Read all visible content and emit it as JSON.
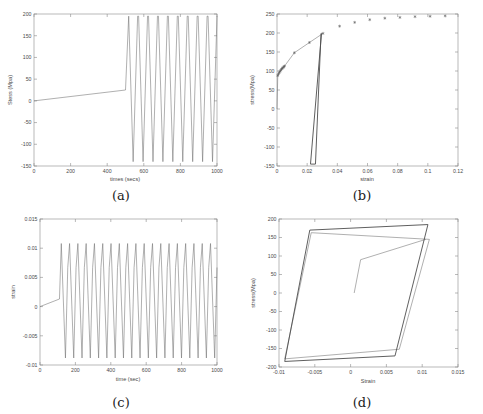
{
  "figure": {
    "panels": [
      {
        "id": "a",
        "caption": "(a)",
        "chart_data": {
          "type": "line",
          "title": "",
          "xlabel": "times (secs)",
          "ylabel": "Stess (Mpa)",
          "xlim": [
            0,
            1000
          ],
          "ylim": [
            -150,
            200
          ],
          "xticks": [
            0,
            200,
            400,
            600,
            800,
            1000
          ],
          "yticks": [
            -150,
            -100,
            -50,
            0,
            50,
            100,
            150,
            200
          ],
          "xticklabels": [
            "0",
            "200",
            "400",
            "600",
            "800",
            "1000"
          ],
          "yticklabels": [
            "-150",
            "-100",
            "-50",
            "0",
            "50",
            "100",
            "150",
            "200"
          ],
          "grid": false,
          "legend": "none",
          "series": [
            {
              "name": "stress history",
              "description": "slow monotonic ramp from 0 to about 25 MPa over the first 500 s, then a sharp rise to 195 MPa followed by nine sustained cycles between about 195 and -140 MPa",
              "ramp": {
                "x": [
                  0,
                  500
                ],
                "y": [
                  0,
                  25
                ]
              },
              "jump": {
                "x": [
                  500,
                  512
                ],
                "y": [
                  25,
                  195
                ]
              },
              "cycles": {
                "n": 9,
                "x_start": 512,
                "x_end": 1000,
                "ymax": 195,
                "ymin": -140
              }
            }
          ]
        }
      },
      {
        "id": "b",
        "caption": "(b)",
        "chart_data": {
          "type": "scatter",
          "title": "",
          "xlabel": "strain",
          "ylabel": "stress(Mpa)",
          "xlim": [
            0,
            0.12
          ],
          "ylim": [
            -150,
            250
          ],
          "xticks": [
            0,
            0.02,
            0.04,
            0.06,
            0.08,
            0.1,
            0.12
          ],
          "yticks": [
            -150,
            -100,
            -50,
            0,
            50,
            100,
            150,
            200,
            250
          ],
          "xticklabels": [
            "0",
            "0.02",
            "0.04",
            "0.06",
            "0.08",
            "0.1",
            "0.12"
          ],
          "yticklabels": [
            "-150",
            "-100",
            "-50",
            "0",
            "50",
            "100",
            "150",
            "200",
            "250"
          ],
          "grid": false,
          "legend": "none",
          "marker_style": "asterisk",
          "series": [
            {
              "name": "monotonic envelope (markers)",
              "x": [
                0.0005,
                0.001,
                0.0015,
                0.002,
                0.0025,
                0.003,
                0.0035,
                0.004,
                0.0045,
                0.005,
                0.0115,
                0.0215,
                0.0305,
                0.0415,
                0.0515,
                0.0615,
                0.0715,
                0.0815,
                0.0915,
                0.1015,
                0.1115
              ],
              "y": [
                88,
                92,
                96,
                99,
                102,
                105,
                107,
                109,
                111,
                113,
                148,
                175,
                199,
                218,
                228,
                235,
                239,
                241,
                243,
                244,
                245
              ]
            },
            {
              "name": "loading curve",
              "description": "smooth hardening curve rising from origin through 88 MPa to 199 MPa at strain 0.0305"
            },
            {
              "name": "unloading branch",
              "description": "steep near-vertical elastic unloading from 199 MPa at strain 0.0295 down to -145 MPa near strain 0.022, with a narrow reload leg back up"
            }
          ]
        }
      },
      {
        "id": "c",
        "caption": "(c)",
        "chart_data": {
          "type": "line",
          "title": "",
          "xlabel": "time (sec)",
          "ylabel": "strain",
          "xlim": [
            0,
            1000
          ],
          "ylim": [
            -0.01,
            0.015
          ],
          "xticks": [
            0,
            200,
            400,
            600,
            800,
            1000
          ],
          "yticks": [
            -0.01,
            -0.005,
            0,
            0.005,
            0.01,
            0.015
          ],
          "xticklabels": [
            "0",
            "200",
            "400",
            "600",
            "800",
            "1000"
          ],
          "yticklabels": [
            "-0.01",
            "-0.005",
            "0",
            "0.005",
            "0.01",
            "0.015"
          ],
          "grid": false,
          "legend": "none",
          "series": [
            {
              "name": "strain history",
              "description": "flat ramp from 0 to about 0.0013 up to 110 s, then 19 steady cycles oscillating between 0.0108 and -0.0088",
              "ramp": {
                "x": [
                  0,
                  110
                ],
                "y": [
                  0,
                  0.0013
                ]
              },
              "cycles": {
                "n": 19,
                "x_start": 110,
                "x_end": 1000,
                "ymax": 0.0108,
                "ymin": -0.0088
              }
            }
          ]
        }
      },
      {
        "id": "d",
        "caption": "(d)",
        "chart_data": {
          "type": "line",
          "title": "",
          "xlabel": "Strain",
          "ylabel": "stress(Mpa)",
          "xlim": [
            -0.01,
            0.015
          ],
          "ylim": [
            -200,
            200
          ],
          "xticks": [
            -0.01,
            -0.005,
            0,
            0.005,
            0.01,
            0.015
          ],
          "yticks": [
            -200,
            -150,
            -100,
            -50,
            0,
            50,
            100,
            150,
            200
          ],
          "xticklabels": [
            "-0.01",
            "-0.005",
            "0",
            "0.005",
            "0.01",
            "0.015"
          ],
          "yticklabels": [
            "-200",
            "-150",
            "-100",
            "-50",
            "0",
            "50",
            "100",
            "150",
            "200"
          ],
          "grid": false,
          "legend": "none",
          "series": [
            {
              "name": "initial loading",
              "description": "monotonic rise from origin to about 90 MPa at strain 0.0014, then shallow hardening out to 145 MPa at strain 0.0105",
              "x": [
                0.0005,
                0.0014,
                0.0105
              ],
              "y": [
                0,
                90,
                145
              ]
            },
            {
              "name": "first hysteresis loop",
              "description": "parallelogram loop with corners near (0.0110, 145), (-0.0055, 163), (-0.0092, -178), (0.0068, -152)",
              "x": [
                0.011,
                -0.0055,
                -0.0092,
                0.0068,
                0.011
              ],
              "y": [
                145,
                163,
                -178,
                -152,
                145
              ]
            },
            {
              "name": "stabilized hysteresis loops",
              "description": "saturated parallelogram cycles with corners near (0.0108, 185), (-0.0057, 170), (-0.0092, -185), (0.0062, -170)",
              "x": [
                0.0108,
                -0.0057,
                -0.0092,
                0.0062,
                0.0108
              ],
              "y": [
                185,
                170,
                -185,
                -170,
                185
              ]
            }
          ]
        }
      }
    ]
  }
}
